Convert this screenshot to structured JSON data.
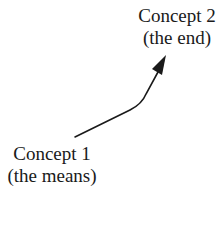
{
  "diagram": {
    "nodes": [
      {
        "id": "concept1",
        "title": "Concept 1",
        "subtitle": "(the means)"
      },
      {
        "id": "concept2",
        "title": "Concept 2",
        "subtitle": "(the end)"
      }
    ],
    "edges": [
      {
        "from": "concept1",
        "to": "concept2",
        "style": "curved-arrow"
      }
    ],
    "colors": {
      "ink": "#1a1a1a",
      "background": "#ffffff"
    }
  }
}
